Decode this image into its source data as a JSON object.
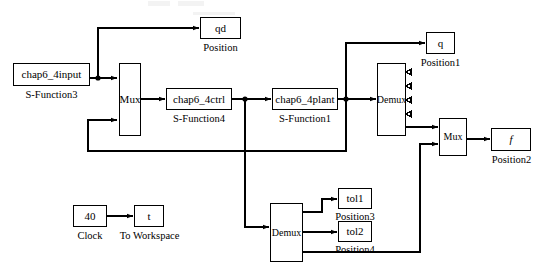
{
  "diagram": {
    "width": 545,
    "height": 277,
    "line_color": "#000000",
    "background": "#ffffff"
  },
  "blocks": {
    "input": {
      "label": "chap6_4input",
      "caption": "S-Function3"
    },
    "mux_left": {
      "label": "Mux",
      "caption": ""
    },
    "ctrl": {
      "label": "chap6_4ctrl",
      "caption": "S-Function4"
    },
    "plant": {
      "label": "chap6_4plant",
      "caption": "S-Function1"
    },
    "demux_top": {
      "label": "Demux",
      "caption": ""
    },
    "demux_bottom": {
      "label": "Demux",
      "caption": ""
    },
    "mux_right": {
      "label": "Mux",
      "caption": ""
    },
    "qd": {
      "label": "qd",
      "caption": "Position"
    },
    "q": {
      "label": "q",
      "caption": "Position1"
    },
    "f": {
      "label": "f",
      "caption": "Position2"
    },
    "tol1": {
      "label": "tol1",
      "caption": "Position3"
    },
    "tol2": {
      "label": "tol2",
      "caption": "Position4"
    },
    "clock": {
      "label": "40",
      "caption": "Clock"
    },
    "to_workspace": {
      "label": "t",
      "caption": "To Workspace"
    }
  }
}
